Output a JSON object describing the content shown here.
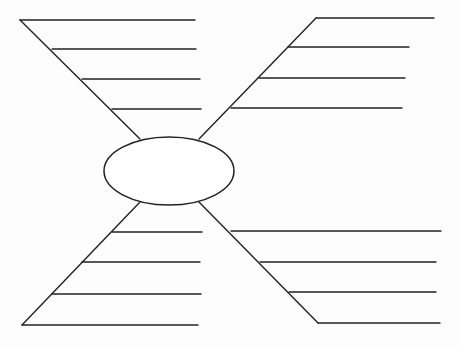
{
  "diagram": {
    "type": "spider-map",
    "stroke_color": "#222222",
    "background": "#ffffff",
    "center": {
      "label": "",
      "cx": 169,
      "cy": 171,
      "rx": 65,
      "ry": 34
    },
    "branches": [
      {
        "name": "top-left",
        "leg": {
          "x1": 140,
          "y1": 139,
          "x2": 20,
          "y2": 20
        },
        "lines": [
          {
            "x1": 20,
            "y1": 20,
            "x2": 195,
            "y2": 20,
            "text": ""
          },
          {
            "x1": 52,
            "y1": 49,
            "x2": 196,
            "y2": 49,
            "text": ""
          },
          {
            "x1": 82,
            "y1": 79,
            "x2": 200,
            "y2": 79,
            "text": ""
          },
          {
            "x1": 112,
            "y1": 109,
            "x2": 201,
            "y2": 109,
            "text": ""
          }
        ]
      },
      {
        "name": "top-right",
        "leg": {
          "x1": 199,
          "y1": 139,
          "x2": 316,
          "y2": 18
        },
        "lines": [
          {
            "x1": 316,
            "y1": 18,
            "x2": 434,
            "y2": 18,
            "text": ""
          },
          {
            "x1": 288,
            "y1": 47,
            "x2": 409,
            "y2": 47,
            "text": ""
          },
          {
            "x1": 259,
            "y1": 78,
            "x2": 405,
            "y2": 78,
            "text": ""
          },
          {
            "x1": 231,
            "y1": 108,
            "x2": 402,
            "y2": 108,
            "text": ""
          }
        ]
      },
      {
        "name": "bottom-left",
        "leg": {
          "x1": 140,
          "y1": 202,
          "x2": 22,
          "y2": 325
        },
        "lines": [
          {
            "x1": 112,
            "y1": 232,
            "x2": 202,
            "y2": 232,
            "text": ""
          },
          {
            "x1": 82,
            "y1": 262,
            "x2": 200,
            "y2": 262,
            "text": ""
          },
          {
            "x1": 52,
            "y1": 294,
            "x2": 201,
            "y2": 294,
            "text": ""
          },
          {
            "x1": 22,
            "y1": 325,
            "x2": 198,
            "y2": 325,
            "text": ""
          }
        ]
      },
      {
        "name": "bottom-right",
        "leg": {
          "x1": 199,
          "y1": 202,
          "x2": 318,
          "y2": 323
        },
        "lines": [
          {
            "x1": 231,
            "y1": 231,
            "x2": 441,
            "y2": 231,
            "text": ""
          },
          {
            "x1": 260,
            "y1": 262,
            "x2": 436,
            "y2": 262,
            "text": ""
          },
          {
            "x1": 289,
            "y1": 292,
            "x2": 436,
            "y2": 292,
            "text": ""
          },
          {
            "x1": 318,
            "y1": 323,
            "x2": 440,
            "y2": 323,
            "text": ""
          }
        ]
      }
    ]
  }
}
